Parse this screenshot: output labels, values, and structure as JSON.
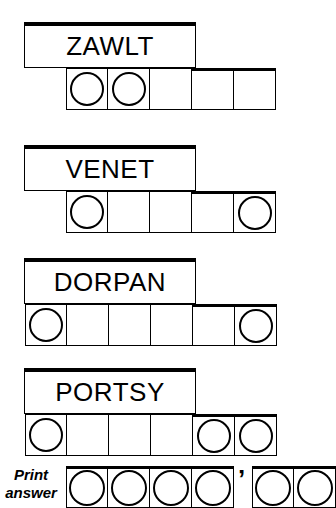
{
  "puzzle": {
    "type": "jumble-word-puzzle",
    "rows": [
      {
        "word": "ZAWLT",
        "cell_count": 5,
        "circled_positions": [
          1,
          2
        ],
        "box_left": 24,
        "box_top": 22,
        "box_width": 172,
        "box_height": 46,
        "grid_left": 66,
        "grid_top": 68,
        "cell_width": 42,
        "cell_height": 42,
        "under_count": 3
      },
      {
        "word": "VENET",
        "cell_count": 5,
        "circled_positions": [
          1,
          5
        ],
        "box_left": 24,
        "box_top": 145,
        "box_width": 172,
        "box_height": 46,
        "grid_left": 66,
        "grid_top": 191,
        "cell_width": 42,
        "cell_height": 42,
        "under_count": 3
      },
      {
        "word": "DORPAN",
        "cell_count": 6,
        "circled_positions": [
          1,
          6
        ],
        "box_left": 24,
        "box_top": 258,
        "box_width": 172,
        "box_height": 46,
        "grid_left": 25,
        "grid_top": 304,
        "cell_width": 42,
        "cell_height": 42,
        "under_count": 4
      },
      {
        "word": "PORTSY",
        "cell_count": 6,
        "circled_positions": [
          1,
          5,
          6
        ],
        "box_left": 24,
        "box_top": 368,
        "box_width": 172,
        "box_height": 46,
        "grid_left": 25,
        "grid_top": 414,
        "cell_width": 42,
        "cell_height": 42,
        "under_count": 4
      }
    ],
    "answer": {
      "label_line1": "Print",
      "label_line2": "answer",
      "separator": "’",
      "separator_left": 238,
      "separator_top": 466,
      "row_top": 466,
      "groups": [
        {
          "left": 66,
          "cell_count": 4,
          "cell_width": 42,
          "cell_height": 42,
          "all_circled": true
        },
        {
          "left": 252,
          "cell_count": 2,
          "cell_width": 42,
          "cell_height": 42,
          "all_circled": true
        }
      ]
    }
  }
}
